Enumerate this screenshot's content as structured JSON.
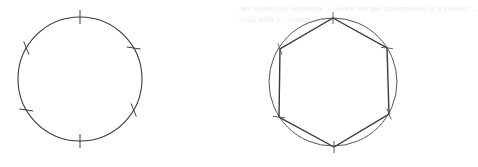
{
  "figure": {
    "bleed_through_text": [
      "... are treated in sequence ... Since we use information in a correct ...",
      "... trial with a ... complicated ..."
    ],
    "stroke_color": "#3a3a3a",
    "circle_color": "#555555",
    "left": {
      "label": "circle-with-six-arc-marks",
      "center": [
        80,
        79
      ],
      "radius": 62,
      "marks_deg": [
        -90,
        -30,
        30,
        90,
        150,
        210
      ]
    },
    "right": {
      "label": "inscribed-regular-hexagon",
      "center": [
        333,
        82
      ],
      "radius": 64,
      "vertices": [
        [
          333,
          18
        ],
        [
          387,
          48
        ],
        [
          389,
          114
        ],
        [
          334,
          147
        ],
        [
          279,
          117
        ],
        [
          280,
          49
        ]
      ]
    }
  }
}
